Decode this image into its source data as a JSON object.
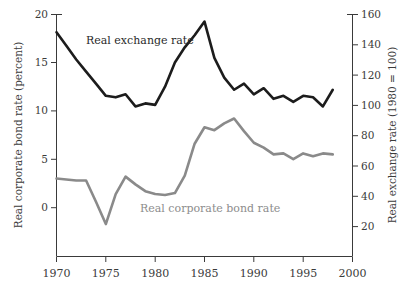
{
  "chart_data": {
    "type": "line",
    "title": "",
    "subtitle": "",
    "xlabel": "",
    "ylabel": "Real corporate bond rate (percent)",
    "y2label": "Real exchange rate (1980 = 100)",
    "grid": false,
    "legend_position": "inline-annotations",
    "xlim": [
      1970,
      2000
    ],
    "ylim": [
      -5,
      20
    ],
    "y2lim": [
      0,
      160
    ],
    "xticks": [
      1970,
      1975,
      1980,
      1985,
      1990,
      1995,
      2000
    ],
    "xtick_labels": [
      "1970",
      "1975",
      "1980",
      "1985",
      "1990",
      "1995",
      "2000"
    ],
    "yticks": [
      0,
      5,
      10,
      15,
      20
    ],
    "ytick_labels": [
      "0",
      "5",
      "10",
      "15",
      "20"
    ],
    "y2ticks": [
      20,
      40,
      60,
      80,
      100,
      120,
      140,
      160
    ],
    "y2tick_labels": [
      "20",
      "40",
      "60",
      "80",
      "100",
      "120",
      "140",
      "160"
    ],
    "x": [
      1970,
      1971,
      1972,
      1973,
      1974,
      1975,
      1976,
      1977,
      1978,
      1979,
      1980,
      1981,
      1982,
      1983,
      1984,
      1985,
      1986,
      1987,
      1988,
      1989,
      1990,
      1991,
      1992,
      1993,
      1994,
      1995,
      1996,
      1997,
      1998
    ],
    "series": [
      {
        "name": "Real exchange rate",
        "axis": "right",
        "color": "#1c1c1c",
        "units": "index (1980 = 100)",
        "values": [
          148,
          139,
          130,
          122,
          114,
          106,
          105,
          107,
          99,
          101,
          100,
          112,
          128,
          138,
          146,
          155,
          131,
          118,
          110,
          114,
          107,
          111,
          104,
          106,
          102,
          106,
          105,
          99,
          110
        ],
        "values_left_scale": [
          18.5,
          17.4,
          16.3,
          15.3,
          14.3,
          13.2,
          13.1,
          13.3,
          12.4,
          12.6,
          12.5,
          14.0,
          16.0,
          17.3,
          18.3,
          19.4,
          16.4,
          14.7,
          13.8,
          14.3,
          13.4,
          13.9,
          13.0,
          13.2,
          12.8,
          13.2,
          13.1,
          12.4,
          13.8
        ]
      },
      {
        "name": "Real corporate bond rate",
        "axis": "left",
        "color": "#8a8a8a",
        "units": "percent",
        "values": [
          3.0,
          2.9,
          2.8,
          2.8,
          0.6,
          -1.7,
          1.4,
          3.2,
          2.4,
          1.7,
          1.4,
          1.3,
          1.5,
          3.3,
          6.6,
          8.3,
          8.0,
          8.7,
          9.2,
          7.9,
          6.7,
          6.2,
          5.5,
          5.6,
          5.0,
          5.6,
          5.3,
          5.6,
          5.5
        ]
      }
    ],
    "annotations": [
      {
        "text": "Real exchange rate",
        "series": "Real exchange rate",
        "color": "#2a2a2a"
      },
      {
        "text": "Real corporate bond rate",
        "series": "Real corporate bond rate",
        "color": "#8d8d8d"
      }
    ]
  }
}
